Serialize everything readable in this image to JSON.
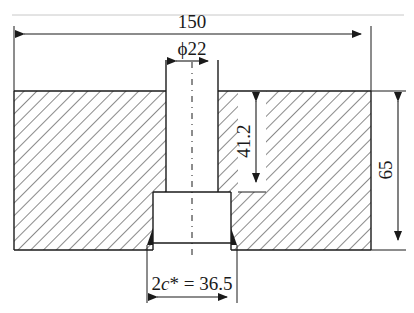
{
  "drawing": {
    "type": "technical-section-drawing",
    "line_color": "#1a1a1a",
    "hatch_color": "#2a2a2a",
    "top_rule_color": "#c8c8c8"
  },
  "dimensions": {
    "overall_width": "150",
    "hole_diameter": "ϕ22",
    "hole_depth": "41.2",
    "overall_height": "65",
    "counterbore_prefix": "2",
    "counterbore_var": "c",
    "counterbore_suffix": "* = 36.5"
  }
}
